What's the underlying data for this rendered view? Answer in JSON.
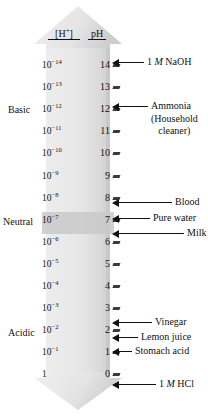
{
  "diagram": {
    "headers": {
      "concentration": "[H+]",
      "concentration_display": "[H",
      "concentration_sup": "+",
      "concentration_close": "]",
      "ph": "pH"
    },
    "categories": [
      {
        "id": "basic",
        "label": "Basic"
      },
      {
        "id": "neutral",
        "label": "Neutral"
      },
      {
        "id": "acidic",
        "label": "Acidic"
      }
    ],
    "colors": {
      "bar_fill_light": "#e8e8e8",
      "bar_fill_shade": "#d0d0d0",
      "neutral_band": "#c9c9c9",
      "ink": "#111111",
      "tick": "#3a3a3a"
    },
    "rows": [
      {
        "ph": "14",
        "mantissa": "10",
        "exponent": "-14"
      },
      {
        "ph": "13",
        "mantissa": "10",
        "exponent": "-13"
      },
      {
        "ph": "12",
        "mantissa": "10",
        "exponent": "-12"
      },
      {
        "ph": "11",
        "mantissa": "10",
        "exponent": "-11"
      },
      {
        "ph": "10",
        "mantissa": "10",
        "exponent": "-10"
      },
      {
        "ph": "9",
        "mantissa": "10",
        "exponent": "-9"
      },
      {
        "ph": "8",
        "mantissa": "10",
        "exponent": "-8"
      },
      {
        "ph": "7",
        "mantissa": "10",
        "exponent": "-7"
      },
      {
        "ph": "6",
        "mantissa": "10",
        "exponent": "-6"
      },
      {
        "ph": "5",
        "mantissa": "10",
        "exponent": "-5"
      },
      {
        "ph": "4",
        "mantissa": "10",
        "exponent": "-4"
      },
      {
        "ph": "3",
        "mantissa": "10",
        "exponent": "-3"
      },
      {
        "ph": "2",
        "mantissa": "10",
        "exponent": "-2"
      },
      {
        "ph": "1",
        "mantissa": "10",
        "exponent": "-1"
      },
      {
        "ph": "0",
        "mantissa": "1",
        "exponent": ""
      }
    ],
    "callouts": [
      {
        "id": "naoh",
        "lines": [
          "1 M NaOH"
        ],
        "ph": "14"
      },
      {
        "id": "ammonia",
        "lines": [
          "Ammonia",
          "(Household",
          "cleaner)"
        ],
        "ph": "12"
      },
      {
        "id": "blood",
        "lines": [
          "Blood"
        ],
        "ph": "7.4"
      },
      {
        "id": "pure-water",
        "lines": [
          "Pure water"
        ],
        "ph": "7"
      },
      {
        "id": "milk",
        "lines": [
          "Milk"
        ],
        "ph": "6.6"
      },
      {
        "id": "vinegar",
        "lines": [
          "Vinegar"
        ],
        "ph": "3"
      },
      {
        "id": "lemon-juice",
        "lines": [
          "Lemon juice"
        ],
        "ph": "2.4"
      },
      {
        "id": "stomach-acid",
        "lines": [
          "Stomach acid"
        ],
        "ph": "2"
      },
      {
        "id": "hcl",
        "lines": [
          "1 M HCl"
        ],
        "ph": "0"
      }
    ]
  },
  "chart_data": {
    "type": "table",
    "xlabel": "",
    "ylabel": "pH",
    "categories": [
      "14",
      "13",
      "12",
      "11",
      "10",
      "9",
      "8",
      "7",
      "6",
      "5",
      "4",
      "3",
      "2",
      "1",
      "0"
    ],
    "series": [
      {
        "name": "[H+] (M)",
        "values": [
          "10^-14",
          "10^-13",
          "10^-12",
          "10^-11",
          "10^-10",
          "10^-9",
          "10^-8",
          "10^-7",
          "10^-6",
          "10^-5",
          "10^-4",
          "10^-3",
          "10^-2",
          "10^-1",
          "1"
        ]
      }
    ],
    "annotations": [
      {
        "ph": 14,
        "label": "1 M NaOH"
      },
      {
        "ph": 12,
        "label": "Ammonia (Household cleaner)"
      },
      {
        "ph": 7.4,
        "label": "Blood"
      },
      {
        "ph": 7,
        "label": "Pure water"
      },
      {
        "ph": 6.6,
        "label": "Milk"
      },
      {
        "ph": 3,
        "label": "Vinegar"
      },
      {
        "ph": 2.4,
        "label": "Lemon juice"
      },
      {
        "ph": 2,
        "label": "Stomach acid"
      },
      {
        "ph": 0,
        "label": "1 M HCl"
      }
    ],
    "regions": [
      {
        "label": "Basic",
        "range": [
          8,
          14
        ]
      },
      {
        "label": "Neutral",
        "range": [
          7,
          7
        ]
      },
      {
        "label": "Acidic",
        "range": [
          0,
          6
        ]
      }
    ]
  }
}
